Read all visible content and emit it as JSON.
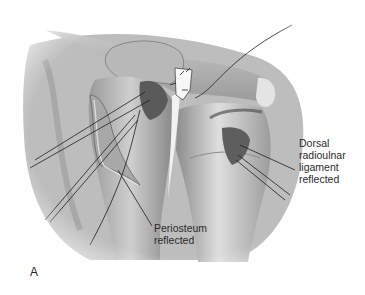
{
  "figure": {
    "panel_letter": "A",
    "labels": [
      {
        "id": "dorsal-radioulnar-ligament",
        "lines": [
          "Dorsal",
          "radioulnar",
          "ligament",
          "reflected"
        ]
      },
      {
        "id": "periosteum",
        "lines": [
          "Periosteum",
          "reflected"
        ]
      }
    ]
  },
  "colors": {
    "background": "#ffffff",
    "bone_light": "#d6d6d6",
    "bone_mid": "#a9a9a9",
    "bone_dark": "#6e6e6e",
    "tissue_dark": "#4a4a4a",
    "suture": "#1e1e1e",
    "text": "#2a2a2a"
  }
}
